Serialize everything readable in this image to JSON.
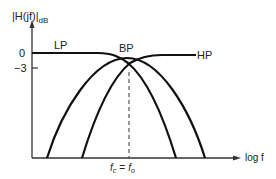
{
  "diagram": {
    "y_axis_label": "|H(jf)|",
    "y_axis_label_sub": "dB",
    "x_axis_label": "log f",
    "y_ticks": [
      {
        "label": "0",
        "y": 53
      },
      {
        "label": "−3",
        "y": 68
      }
    ],
    "curves": [
      {
        "name": "LP",
        "label": "LP"
      },
      {
        "name": "BP",
        "label": "BP"
      },
      {
        "name": "HP",
        "label": "HP"
      }
    ],
    "marker_label_left": "f",
    "marker_label_left_sub": "c",
    "marker_label_eq": "=",
    "marker_label_right": "f",
    "marker_label_right_sub": "o",
    "line_color": "#111111"
  }
}
